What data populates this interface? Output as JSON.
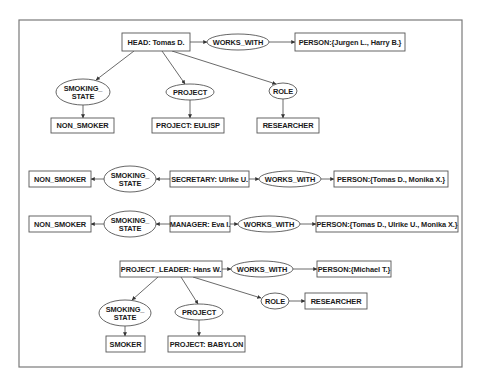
{
  "diagram": {
    "frame": {
      "x": 19,
      "y": 20,
      "w": 443,
      "h": 347
    },
    "colors": {
      "stroke": "#555555",
      "text": "#1a1a1a",
      "frame": "#7a7a7a",
      "background": "#ffffff"
    },
    "nodes": [
      {
        "id": "g1_head",
        "type": "concept",
        "label": "HEAD: Tomas D.",
        "x": 122,
        "y": 33,
        "w": 68,
        "h": 18
      },
      {
        "id": "g1_works",
        "type": "relation",
        "label": "WORKS_WITH",
        "cx": 238,
        "cy": 42,
        "rx": 31,
        "ry": 8
      },
      {
        "id": "g1_person",
        "type": "concept",
        "label": "PERSON:{Jurgen L., Harry B.}",
        "x": 295,
        "y": 33,
        "w": 110,
        "h": 18
      },
      {
        "id": "g1_smoking",
        "type": "relation",
        "label": "SMOKING_",
        "label2": "STATE",
        "cx": 83,
        "cy": 92,
        "rx": 27,
        "ry": 13
      },
      {
        "id": "g1_nonsmoker",
        "type": "concept",
        "label": "NON_SMOKER",
        "x": 51,
        "y": 118,
        "w": 63,
        "h": 15
      },
      {
        "id": "g1_project",
        "type": "relation",
        "label": "PROJECT",
        "cx": 190,
        "cy": 92,
        "rx": 24,
        "ry": 8
      },
      {
        "id": "g1_eulisp",
        "type": "concept",
        "label": "PROJECT: EULISP",
        "x": 152,
        "y": 118,
        "w": 72,
        "h": 15
      },
      {
        "id": "g1_role",
        "type": "relation",
        "label": "ROLE",
        "cx": 283,
        "cy": 91,
        "rx": 14,
        "ry": 8
      },
      {
        "id": "g1_researcher",
        "type": "concept",
        "label": "RESEARCHER",
        "x": 257,
        "y": 118,
        "w": 62,
        "h": 15
      },
      {
        "id": "g2_nonsmoker",
        "type": "concept",
        "label": "NON_SMOKER",
        "x": 29,
        "y": 171,
        "w": 62,
        "h": 16
      },
      {
        "id": "g2_smoking",
        "type": "relation",
        "label": "SMOKING_",
        "label2": "STATE",
        "cx": 130,
        "cy": 179,
        "rx": 26,
        "ry": 13
      },
      {
        "id": "g2_secretary",
        "type": "concept",
        "label": "SECRETARY: Ulrike U.",
        "x": 170,
        "y": 171,
        "w": 79,
        "h": 16
      },
      {
        "id": "g2_works",
        "type": "relation",
        "label": "WORKS_WITH",
        "cx": 290,
        "cy": 179,
        "rx": 31,
        "ry": 8
      },
      {
        "id": "g2_person",
        "type": "concept",
        "label": "PERSON:{Tomas D., Monika X.}",
        "x": 334,
        "y": 171,
        "w": 114,
        "h": 16
      },
      {
        "id": "g3_nonsmoker",
        "type": "concept",
        "label": "NON_SMOKER",
        "x": 29,
        "y": 216,
        "w": 62,
        "h": 16
      },
      {
        "id": "g3_smoking",
        "type": "relation",
        "label": "SMOKING_",
        "label2": "STATE",
        "cx": 130,
        "cy": 224,
        "rx": 26,
        "ry": 13
      },
      {
        "id": "g3_manager",
        "type": "concept",
        "label": "MANAGER: Eva I.",
        "x": 170,
        "y": 216,
        "w": 60,
        "h": 16
      },
      {
        "id": "g3_works",
        "type": "relation",
        "label": "WORKS_WITH",
        "cx": 269,
        "cy": 224,
        "rx": 31,
        "ry": 8
      },
      {
        "id": "g3_person",
        "type": "concept",
        "label": "PERSON:{Tomas D., Ulrike U., Monika X.}",
        "x": 316,
        "y": 216,
        "w": 142,
        "h": 16
      },
      {
        "id": "g4_leader",
        "type": "concept",
        "label": "PROJECT_LEADER: Hans W.",
        "x": 120,
        "y": 261,
        "w": 102,
        "h": 16
      },
      {
        "id": "g4_works",
        "type": "relation",
        "label": "WORKS_WITH",
        "cx": 262,
        "cy": 269,
        "rx": 31,
        "ry": 8
      },
      {
        "id": "g4_person",
        "type": "concept",
        "label": "PERSON:{Michael T.}",
        "x": 317,
        "y": 261,
        "w": 74,
        "h": 16
      },
      {
        "id": "g4_smoking",
        "type": "relation",
        "label": "SMOKING_",
        "label2": "STATE",
        "cx": 125,
        "cy": 313,
        "rx": 26,
        "ry": 13
      },
      {
        "id": "g4_smoker",
        "type": "concept",
        "label": "SMOKER",
        "x": 106,
        "y": 336,
        "w": 39,
        "h": 16
      },
      {
        "id": "g4_project",
        "type": "relation",
        "label": "PROJECT",
        "cx": 199,
        "cy": 312,
        "rx": 24,
        "ry": 8
      },
      {
        "id": "g4_babylon",
        "type": "concept",
        "label": "PROJECT: BABYLON",
        "x": 168,
        "y": 336,
        "w": 77,
        "h": 16
      },
      {
        "id": "g4_role",
        "type": "relation",
        "label": "ROLE",
        "cx": 275,
        "cy": 301,
        "rx": 14,
        "ry": 8
      },
      {
        "id": "g4_researcher",
        "type": "concept",
        "label": "RESEARCHER",
        "x": 305,
        "y": 293,
        "w": 62,
        "h": 16
      }
    ],
    "edges": [
      {
        "from": [
          190,
          42
        ],
        "to": [
          207,
          42
        ]
      },
      {
        "from": [
          269,
          42
        ],
        "to": [
          295,
          42
        ]
      },
      {
        "from": [
          134,
          51
        ],
        "to": [
          96,
          80
        ]
      },
      {
        "from": [
          83,
          105
        ],
        "to": [
          83,
          118
        ]
      },
      {
        "from": [
          162,
          51
        ],
        "to": [
          185,
          84
        ]
      },
      {
        "from": [
          190,
          100
        ],
        "to": [
          190,
          118
        ]
      },
      {
        "from": [
          172,
          51
        ],
        "to": [
          276,
          84
        ]
      },
      {
        "from": [
          283,
          99
        ],
        "to": [
          283,
          118
        ]
      },
      {
        "from": [
          170,
          179
        ],
        "to": [
          156,
          179
        ]
      },
      {
        "from": [
          104,
          179
        ],
        "to": [
          91,
          179
        ]
      },
      {
        "from": [
          249,
          179
        ],
        "to": [
          259,
          179
        ]
      },
      {
        "from": [
          321,
          179
        ],
        "to": [
          334,
          179
        ]
      },
      {
        "from": [
          170,
          224
        ],
        "to": [
          156,
          224
        ]
      },
      {
        "from": [
          104,
          224
        ],
        "to": [
          91,
          224
        ]
      },
      {
        "from": [
          230,
          224
        ],
        "to": [
          238,
          224
        ]
      },
      {
        "from": [
          300,
          224
        ],
        "to": [
          316,
          224
        ]
      },
      {
        "from": [
          222,
          269
        ],
        "to": [
          231,
          269
        ]
      },
      {
        "from": [
          293,
          269
        ],
        "to": [
          317,
          269
        ]
      },
      {
        "from": [
          158,
          277
        ],
        "to": [
          132,
          300
        ]
      },
      {
        "from": [
          125,
          326
        ],
        "to": [
          125,
          336
        ]
      },
      {
        "from": [
          181,
          277
        ],
        "to": [
          198,
          304
        ]
      },
      {
        "from": [
          199,
          320
        ],
        "to": [
          199,
          336
        ]
      },
      {
        "from": [
          193,
          277
        ],
        "to": [
          261,
          298
        ]
      },
      {
        "from": [
          289,
          301
        ],
        "to": [
          305,
          301
        ]
      }
    ]
  }
}
